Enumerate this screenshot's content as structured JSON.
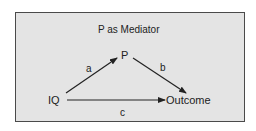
{
  "diagram": {
    "title": "P as Mediator",
    "nodes": [
      {
        "id": "IQ",
        "label": "IQ"
      },
      {
        "id": "P",
        "label": "P"
      },
      {
        "id": "Outcome",
        "label": "Outcome"
      }
    ],
    "edges": [
      {
        "from": "IQ",
        "to": "P",
        "label": "a"
      },
      {
        "from": "P",
        "to": "Outcome",
        "label": "b"
      },
      {
        "from": "IQ",
        "to": "Outcome",
        "label": "c"
      }
    ],
    "colors": {
      "background": "#e4e4e4",
      "border": "#4a4a4a",
      "ink": "#222222"
    }
  }
}
